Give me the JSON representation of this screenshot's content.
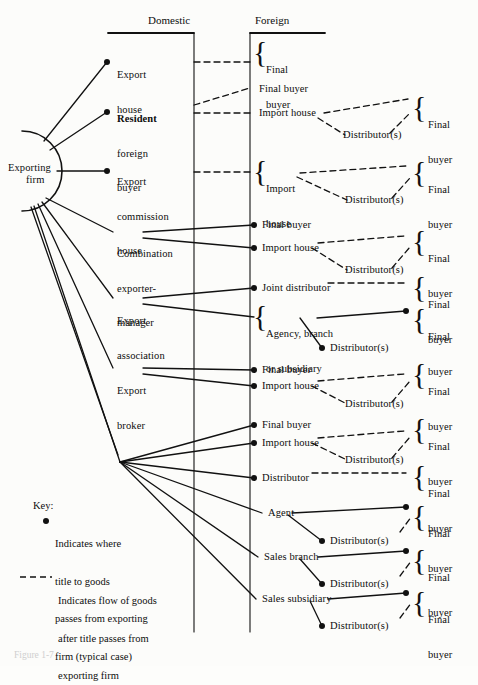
{
  "figure": {
    "caption": "Figure 1-7",
    "headers": [
      {
        "id": "domestic",
        "label": "Domestic",
        "x": 148,
        "y": 20,
        "rule_x1": 108,
        "rule_x2": 194,
        "rule_y": 33,
        "axis_x": 194
      },
      {
        "id": "foreign",
        "label": "Foreign",
        "x": 255,
        "y": 20,
        "rule_x1": 250,
        "rule_x2": 325,
        "rule_y": 33,
        "axis_x": 250
      }
    ],
    "origin": {
      "label_line1": "Exporting",
      "label_line2": "firm",
      "cx": 30,
      "cy": 170
    },
    "hub": {
      "x": 120,
      "y": 462
    },
    "domestic_nodes": [
      {
        "id": "export-house",
        "lines": [
          "Export",
          "house"
        ],
        "x": 117,
        "y": 50,
        "dot_x": 107,
        "dot_y": 62
      },
      {
        "id": "resident-foreign-buyer",
        "lines": [
          "Resident",
          "foreign",
          "buyer"
        ],
        "x": 117,
        "y": 92,
        "dot_x": 107,
        "dot_y": 112,
        "bold_first": true
      },
      {
        "id": "export-commission-house",
        "lines": [
          "Export",
          "commission",
          "house"
        ],
        "x": 117,
        "y": 155,
        "dot_x": 107,
        "dot_y": 175
      },
      {
        "id": "combination-exporter-manager",
        "lines": [
          "Combination",
          "exporter-",
          "manager"
        ],
        "x": 117,
        "y": 227,
        "dot_x": null,
        "dot_y": null
      },
      {
        "id": "export-association",
        "lines": [
          "Export",
          "association"
        ],
        "x": 117,
        "y": 295,
        "dot_x": null,
        "dot_y": null
      },
      {
        "id": "export-broker",
        "lines": [
          "Export",
          "broker"
        ],
        "x": 117,
        "y": 365,
        "dot_x": null,
        "dot_y": null
      }
    ],
    "foreign_nodes": [
      {
        "id": "final-buyer-1",
        "lines": [
          "Final",
          "buyer"
        ],
        "x": 266,
        "y": 44,
        "brace": true,
        "brace_x": 255,
        "brace_y": 42,
        "dot": false
      },
      {
        "id": "final-buyer-2",
        "lines": [
          "Final buyer"
        ],
        "x": 259,
        "y": 90,
        "brace": false,
        "dot": false
      },
      {
        "id": "import-house-1",
        "lines": [
          "Import house"
        ],
        "x": 259,
        "y": 110,
        "brace": false,
        "dot": false
      },
      {
        "id": "distributor-s-1",
        "lines": [
          "Distributor(s)"
        ],
        "x": 330,
        "y": 133,
        "brace": false,
        "dot": false
      },
      {
        "id": "import-house-2",
        "lines": [
          "Import",
          "house"
        ],
        "x": 266,
        "y": 163,
        "brace": true,
        "brace_x": 255,
        "brace_y": 161,
        "dot": false
      },
      {
        "id": "distributor-s-2",
        "lines": [
          "Distributor(s)"
        ],
        "x": 330,
        "y": 198,
        "brace": false,
        "dot": false
      },
      {
        "id": "final-buyer-3",
        "lines": [
          "Final buyer"
        ],
        "x": 262,
        "y": 219,
        "brace": false,
        "dot": true,
        "dot_x": 254,
        "dot_y": 225
      },
      {
        "id": "import-house-3",
        "lines": [
          "Import house"
        ],
        "x": 262,
        "y": 242,
        "brace": false,
        "dot": true,
        "dot_x": 254,
        "dot_y": 248
      },
      {
        "id": "distributor-s-3",
        "lines": [
          "Distributor(s)"
        ],
        "x": 330,
        "y": 268,
        "brace": false,
        "dot": false
      },
      {
        "id": "joint-distributor",
        "lines": [
          "Joint distributor"
        ],
        "x": 262,
        "y": 282,
        "brace": false,
        "dot": true,
        "dot_x": 254,
        "dot_y": 288
      },
      {
        "id": "agency-branch-or-subsidiary",
        "lines": [
          "Agency, branch",
          "or subsidiary"
        ],
        "x": 266,
        "y": 308,
        "brace": true,
        "brace_x": 255,
        "brace_y": 307,
        "dot": false
      },
      {
        "id": "distributor-s-4",
        "lines": [
          "Distributor(s)"
        ],
        "x": 330,
        "y": 342,
        "brace": false,
        "dot": true,
        "dot_x": 322,
        "dot_y": 348
      },
      {
        "id": "final-buyer-4",
        "lines": [
          "Final buyer"
        ],
        "x": 262,
        "y": 364,
        "brace": false,
        "dot": true,
        "dot_x": 254,
        "dot_y": 370
      },
      {
        "id": "import-house-4",
        "lines": [
          "Import house"
        ],
        "x": 262,
        "y": 380,
        "brace": false,
        "dot": true,
        "dot_x": 254,
        "dot_y": 386
      },
      {
        "id": "distributor-s-5",
        "lines": [
          "Distributor(s)"
        ],
        "x": 330,
        "y": 402,
        "brace": false,
        "dot": false
      },
      {
        "id": "final-buyer-5",
        "lines": [
          "Final buyer"
        ],
        "x": 262,
        "y": 419,
        "brace": false,
        "dot": true,
        "dot_x": 254,
        "dot_y": 425
      },
      {
        "id": "import-house-5",
        "lines": [
          "Import house"
        ],
        "x": 262,
        "y": 437,
        "brace": false,
        "dot": true,
        "dot_x": 254,
        "dot_y": 443
      },
      {
        "id": "distributor-s-6",
        "lines": [
          "Distributor(s)"
        ],
        "x": 330,
        "y": 458,
        "brace": false,
        "dot": false
      },
      {
        "id": "distributor",
        "lines": [
          "Distributor"
        ],
        "x": 262,
        "y": 472,
        "brace": false,
        "dot": true,
        "dot_x": 254,
        "dot_y": 478
      },
      {
        "id": "agent",
        "lines": [
          "Agent"
        ],
        "x": 268,
        "y": 512,
        "brace": false,
        "dot": false
      },
      {
        "id": "distributor-s-7",
        "lines": [
          "Distributor(s)"
        ],
        "x": 330,
        "y": 535,
        "brace": false,
        "dot": true,
        "dot_x": 322,
        "dot_y": 541
      },
      {
        "id": "sales-branch",
        "lines": [
          "Sales branch"
        ],
        "x": 264,
        "y": 556,
        "brace": false,
        "dot": false
      },
      {
        "id": "distributor-s-8",
        "lines": [
          "Distributor(s)"
        ],
        "x": 330,
        "y": 578,
        "brace": false,
        "dot": true,
        "dot_x": 322,
        "dot_y": 584
      },
      {
        "id": "sales-subsidiary",
        "lines": [
          "Sales subsidiary"
        ],
        "x": 262,
        "y": 598,
        "brace": false,
        "dot": false
      },
      {
        "id": "distributor-s-9",
        "lines": [
          "Distributor(s)"
        ],
        "x": 330,
        "y": 620,
        "brace": false,
        "dot": true,
        "dot_x": 322,
        "dot_y": 626
      }
    ],
    "final_buyers": [
      {
        "id": "fb-r1",
        "lines": [
          "Final",
          "buyer"
        ],
        "x": 428,
        "y": 101,
        "brace_x": 414,
        "brace_y": 99
      },
      {
        "id": "fb-r2",
        "lines": [
          "Final",
          "buyer"
        ],
        "x": 428,
        "y": 166,
        "brace_x": 414,
        "brace_y": 164
      },
      {
        "id": "fb-r3",
        "lines": [
          "Final",
          "buyer"
        ],
        "x": 428,
        "y": 231,
        "brace_x": 414,
        "brace_y": 229
      },
      {
        "id": "fb-r4",
        "lines": [
          "Final",
          "buyer"
        ],
        "x": 428,
        "y": 277,
        "brace_x": 414,
        "brace_y": 275
      },
      {
        "id": "fb-r5",
        "lines": [
          "Final",
          "buyer"
        ],
        "x": 428,
        "y": 310,
        "brace_x": 414,
        "brace_y": 308
      },
      {
        "id": "fb-r6",
        "lines": [
          "Final",
          "buyer"
        ],
        "x": 428,
        "y": 364,
        "brace_x": 414,
        "brace_y": 362
      },
      {
        "id": "fb-r7",
        "lines": [
          "Final",
          "buyer"
        ],
        "x": 428,
        "y": 419,
        "brace_x": 414,
        "brace_y": 417
      },
      {
        "id": "fb-r8",
        "lines": [
          "Final",
          "buyer"
        ],
        "x": 428,
        "y": 466,
        "brace_x": 414,
        "brace_y": 464
      },
      {
        "id": "fb-r9",
        "lines": [
          "Final",
          "buyer"
        ],
        "x": 428,
        "y": 506,
        "brace_x": 414,
        "brace_y": 504
      },
      {
        "id": "fb-r10",
        "lines": [
          "Final",
          "buyer"
        ],
        "x": 428,
        "y": 550,
        "brace_x": 414,
        "brace_y": 548
      },
      {
        "id": "fb-r11",
        "lines": [
          "Final",
          "buyer"
        ],
        "x": 428,
        "y": 592,
        "brace_x": 414,
        "brace_y": 590
      }
    ],
    "key": {
      "title": "Key:",
      "title_x": 33,
      "title_y": 505,
      "dot_entry": [
        "Indicates where",
        "title to goods",
        "passes from exporting",
        "firm (typical case)"
      ],
      "dot_x": 46,
      "dot_y": 521,
      "dot_text_x": 55,
      "dot_text_y": 515,
      "dash_entry": [
        "Indicates flow of goods",
        "after title passes from",
        "exporting firm"
      ],
      "dash_x1": 20,
      "dash_x2": 52,
      "dash_y": 577,
      "dash_text_x": 58,
      "dash_text_y": 570
    }
  },
  "colors": {
    "ink": "#0d0d0d",
    "line": "#111111",
    "background": "#fcfcfa",
    "caption": "#cfcfcf"
  }
}
